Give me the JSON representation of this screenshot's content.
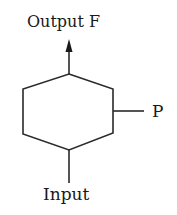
{
  "diagram": {
    "type": "block-diagram",
    "shape": "hexagon",
    "colors": {
      "stroke": "#2a2a2a",
      "text": "#1a1a1a",
      "background": "#ffffff"
    },
    "labels": {
      "output": "Output F",
      "parameter": "P",
      "input": "Input"
    },
    "connections": [
      {
        "from": "hexagon",
        "to": "Output F",
        "direction": "up",
        "arrow": true
      },
      {
        "from": "P",
        "to": "hexagon",
        "direction": "left",
        "arrow": false
      },
      {
        "from": "Input",
        "to": "hexagon",
        "direction": "up",
        "arrow": false
      }
    ]
  }
}
